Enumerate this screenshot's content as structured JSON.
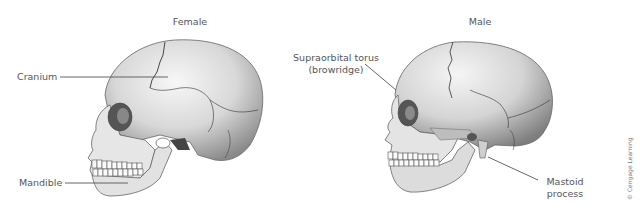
{
  "figure": {
    "female": {
      "title": "Female",
      "labels": {
        "cranium": "Cranium",
        "mandible": "Mandible"
      }
    },
    "male": {
      "title": "Male",
      "labels": {
        "supraorbital_line1": "Supraorbital torus",
        "supraorbital_line2": "(browridge)",
        "mastoid_line1": "Mastoid",
        "mastoid_line2": "process"
      }
    },
    "credit": "© Cengage Learning"
  }
}
